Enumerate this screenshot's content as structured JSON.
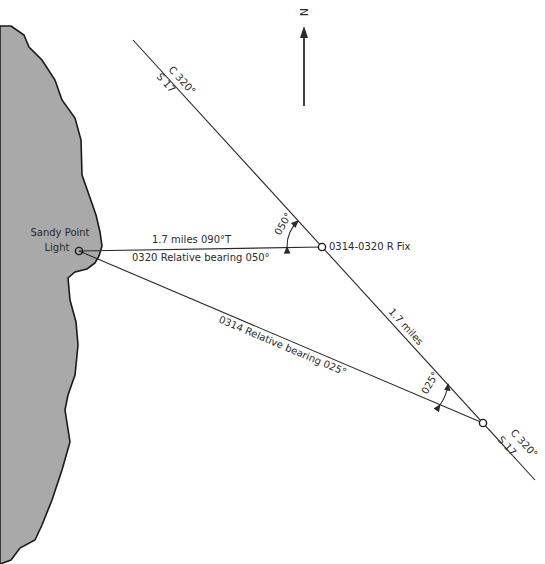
{
  "diagram": {
    "north_label": "N",
    "landmark": {
      "name_line1": "Sandy Point",
      "name_line2": "Light"
    },
    "course_top": {
      "course": "C 320°",
      "speed": "S 17"
    },
    "course_bottom": {
      "course": "C 320°",
      "speed": "S 17"
    },
    "fix_label": "0314-0320 R Fix",
    "bearing_line_1": {
      "distance": "1.7 miles 090°T",
      "relative": "0320 Relative bearing 050°"
    },
    "bearing_line_2": {
      "relative": "0314 Relative bearing 025°"
    },
    "run_distance": "1.7 miles",
    "angle_1": "050°",
    "angle_2": "025°"
  },
  "colors": {
    "land": "#a9a9a9",
    "line": "#2a2a2a",
    "background": "#ffffff"
  }
}
